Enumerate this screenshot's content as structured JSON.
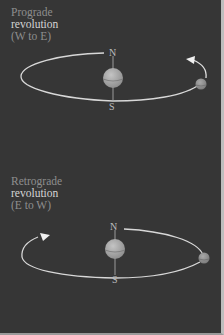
{
  "figure": {
    "panels": [
      {
        "id": "prograde",
        "title_lines": [
          "Prograde",
          "revolution",
          "(W to E)"
        ],
        "pole_labels": {
          "north": "N",
          "south": "S"
        },
        "direction": "counterclockwise (W to E)"
      },
      {
        "id": "retrograde",
        "title_lines": [
          "Retrograde",
          "revolution",
          "(E to W)"
        ],
        "pole_labels": {
          "north": "N",
          "south": "S"
        },
        "direction": "clockwise (E to W)"
      }
    ],
    "colors": {
      "background": "#363636",
      "orbit": "#d8d8d8",
      "body": "#a8a8a8",
      "label_dim": "#8e8e8e",
      "label_bright": "#d4d4d4"
    }
  }
}
